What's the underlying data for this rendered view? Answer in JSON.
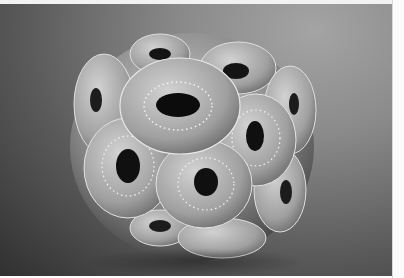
{
  "image": {
    "subject": "coccolithophore sphere",
    "style": "scanning electron micrograph, grayscale",
    "colors": {
      "background_light": "#a4a4a4",
      "background_dark": "#303030",
      "plate_light": "#d0d0d0",
      "plate_mid": "#9a9a9a",
      "hole": "#101010",
      "border": "#fbfbfb"
    }
  }
}
